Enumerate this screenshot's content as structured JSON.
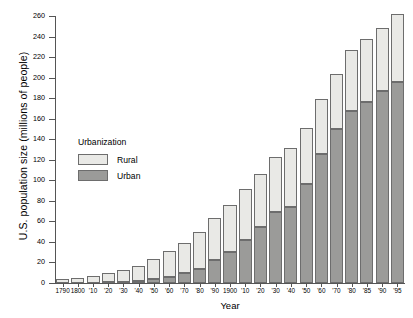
{
  "chart_data": {
    "type": "bar",
    "stacked": true,
    "title": "",
    "xlabel": "Year",
    "ylabel": "U.S. population size (millions of people)",
    "ylim": [
      0,
      260
    ],
    "ytick_step": 20,
    "yticks": [
      0,
      20,
      40,
      60,
      80,
      100,
      120,
      140,
      160,
      180,
      200,
      220,
      240,
      260
    ],
    "grid": false,
    "legend": {
      "title": "Urbanization",
      "position": "inside-upper-left",
      "entries": [
        {
          "name": "Rural",
          "color": "#e9e9e6"
        },
        {
          "name": "Urban",
          "color": "#9b9b99"
        }
      ]
    },
    "categories": [
      "1790",
      "1800",
      "'10",
      "'20",
      "'30",
      "'40",
      "'50",
      "'60",
      "'70",
      "'80",
      "'90",
      "1900",
      "'10",
      "'20",
      "'30",
      "'40",
      "'50",
      "'60",
      "'70",
      "'80",
      "'85",
      "'90",
      "'95"
    ],
    "series": [
      {
        "name": "Urban",
        "color": "#9b9b99",
        "values": [
          0.2,
          0.3,
          0.5,
          0.7,
          1.1,
          1.8,
          3.5,
          6.2,
          9.9,
          14.1,
          22.1,
          30.2,
          42.0,
          54.2,
          69.0,
          74.4,
          96.5,
          125.3,
          149.6,
          167.1,
          176.0,
          187.1,
          196.0
        ]
      },
      {
        "name": "Rural",
        "color": "#e9e9e6",
        "values": [
          3.7,
          4.99,
          6.7,
          8.9,
          11.7,
          15.2,
          19.6,
          25.2,
          28.7,
          36.0,
          40.8,
          45.8,
          50.0,
          51.6,
          54.0,
          57.2,
          54.5,
          54.0,
          53.6,
          59.5,
          62.0,
          61.6,
          66.0
        ]
      }
    ]
  }
}
